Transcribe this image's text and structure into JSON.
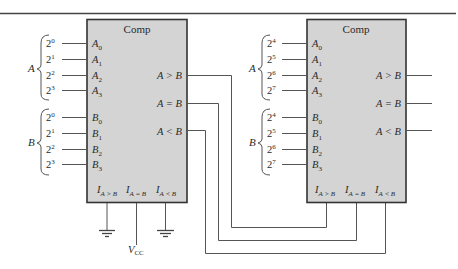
{
  "diagram": {
    "comparators": [
      {
        "id": "left",
        "label": "Comp",
        "a_group_label": "A",
        "b_group_label": "B",
        "a_inputs": [
          {
            "weight": "2",
            "exp": "0",
            "pin": "A",
            "sub": "0"
          },
          {
            "weight": "2",
            "exp": "1",
            "pin": "A",
            "sub": "1"
          },
          {
            "weight": "2",
            "exp": "2",
            "pin": "A",
            "sub": "2"
          },
          {
            "weight": "2",
            "exp": "3",
            "pin": "A",
            "sub": "3"
          }
        ],
        "b_inputs": [
          {
            "weight": "2",
            "exp": "0",
            "pin": "B",
            "sub": "0"
          },
          {
            "weight": "2",
            "exp": "1",
            "pin": "B",
            "sub": "1"
          },
          {
            "weight": "2",
            "exp": "2",
            "pin": "B",
            "sub": "2"
          },
          {
            "weight": "2",
            "exp": "3",
            "pin": "B",
            "sub": "3"
          }
        ],
        "outputs": [
          "A > B",
          "A = B",
          "A < B"
        ],
        "cascade_inputs": [
          {
            "pin": "I",
            "sub": "A > B",
            "connection": "ground"
          },
          {
            "pin": "I",
            "sub": "A = B",
            "connection": "VCC"
          },
          {
            "pin": "I",
            "sub": "A < B",
            "connection": "ground"
          }
        ]
      },
      {
        "id": "right",
        "label": "Comp",
        "a_group_label": "A",
        "b_group_label": "B",
        "a_inputs": [
          {
            "weight": "2",
            "exp": "4",
            "pin": "A",
            "sub": "0"
          },
          {
            "weight": "2",
            "exp": "5",
            "pin": "A",
            "sub": "1"
          },
          {
            "weight": "2",
            "exp": "6",
            "pin": "A",
            "sub": "2"
          },
          {
            "weight": "2",
            "exp": "7",
            "pin": "A",
            "sub": "3"
          }
        ],
        "b_inputs": [
          {
            "weight": "2",
            "exp": "4",
            "pin": "B",
            "sub": "0"
          },
          {
            "weight": "2",
            "exp": "5",
            "pin": "B",
            "sub": "1"
          },
          {
            "weight": "2",
            "exp": "6",
            "pin": "B",
            "sub": "2"
          },
          {
            "weight": "2",
            "exp": "7",
            "pin": "B",
            "sub": "3"
          }
        ],
        "outputs": [
          "A > B",
          "A = B",
          "A < B"
        ],
        "cascade_inputs": [
          {
            "pin": "I",
            "sub": "A > B",
            "connection": "left A > B"
          },
          {
            "pin": "I",
            "sub": "A = B",
            "connection": "left A = B"
          },
          {
            "pin": "I",
            "sub": "A < B",
            "connection": "left A < B"
          }
        ]
      }
    ],
    "supply": {
      "label": "V",
      "sub": "CC"
    }
  }
}
